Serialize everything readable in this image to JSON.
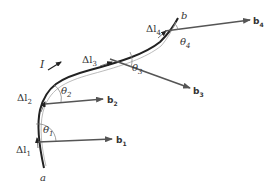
{
  "diagram": {
    "current_label": "I",
    "endpoints": {
      "start": "a",
      "end": "b"
    },
    "segments": [
      {
        "delta_label": "Δl",
        "sub": "1",
        "vector": "b",
        "vector_sub": "1",
        "angle": "θ",
        "angle_sub": "1"
      },
      {
        "delta_label": "Δl",
        "sub": "2",
        "vector": "b",
        "vector_sub": "2",
        "angle": "θ",
        "angle_sub": "2"
      },
      {
        "delta_label": "Δl",
        "sub": "3",
        "vector": "b",
        "vector_sub": "3",
        "angle": "θ",
        "angle_sub": "3"
      },
      {
        "delta_label": "Δl",
        "sub": "4",
        "vector": "b",
        "vector_sub": "4",
        "angle": "θ",
        "angle_sub": "4"
      }
    ],
    "colors": {
      "wire": "#222222",
      "vector": "#555555",
      "text": "#333333"
    }
  }
}
